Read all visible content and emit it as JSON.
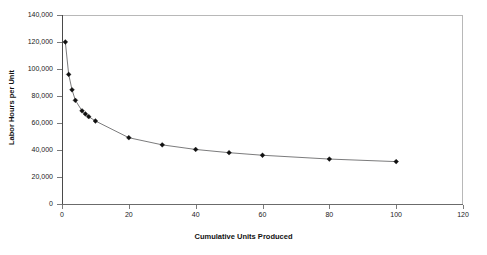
{
  "chart_data": {
    "type": "line",
    "title": "",
    "subtitle": "",
    "xlabel": "Cumulative Units Produced",
    "ylabel": "Labor Hours per Unit",
    "xlim": [
      0,
      120
    ],
    "ylim": [
      0,
      140000
    ],
    "grid": false,
    "legend": "none",
    "marker": "diamond",
    "line_color": "#59595b",
    "marker_color": "#101010",
    "x_ticks": [
      0,
      20,
      40,
      60,
      80,
      100,
      120
    ],
    "x_tick_labels": [
      "0",
      "20",
      "40",
      "60",
      "80",
      "100",
      "120"
    ],
    "y_ticks": [
      0,
      20000,
      40000,
      60000,
      80000,
      100000,
      120000,
      140000
    ],
    "y_tick_labels": [
      "0",
      "20,000",
      "40,000",
      "60,000",
      "80,000",
      "100,000",
      "120,000",
      "140,000"
    ],
    "series": [
      {
        "name": "Labor Hours per Unit",
        "x": [
          1,
          2,
          3,
          4,
          6,
          7,
          8,
          10,
          20,
          30,
          40,
          50,
          60,
          80,
          100
        ],
        "values": [
          120000,
          96000,
          84600,
          76800,
          69000,
          66700,
          64700,
          61500,
          49100,
          43800,
          40400,
          38000,
          36100,
          33300,
          31400
        ]
      }
    ],
    "points": [
      {
        "x": 1,
        "y": 120000
      },
      {
        "x": 2,
        "y": 96000
      },
      {
        "x": 3,
        "y": 84600
      },
      {
        "x": 4,
        "y": 76800
      },
      {
        "x": 6,
        "y": 69000
      },
      {
        "x": 7,
        "y": 66700
      },
      {
        "x": 8,
        "y": 64700
      },
      {
        "x": 10,
        "y": 61500
      },
      {
        "x": 20,
        "y": 49100
      },
      {
        "x": 30,
        "y": 43800
      },
      {
        "x": 40,
        "y": 40400
      },
      {
        "x": 50,
        "y": 38000
      },
      {
        "x": 60,
        "y": 36100
      },
      {
        "x": 80,
        "y": 33300
      },
      {
        "x": 100,
        "y": 31400
      }
    ]
  },
  "axes": {
    "y_title": "Labor Hours per Unit",
    "x_title": "Cumulative Units Produced"
  }
}
